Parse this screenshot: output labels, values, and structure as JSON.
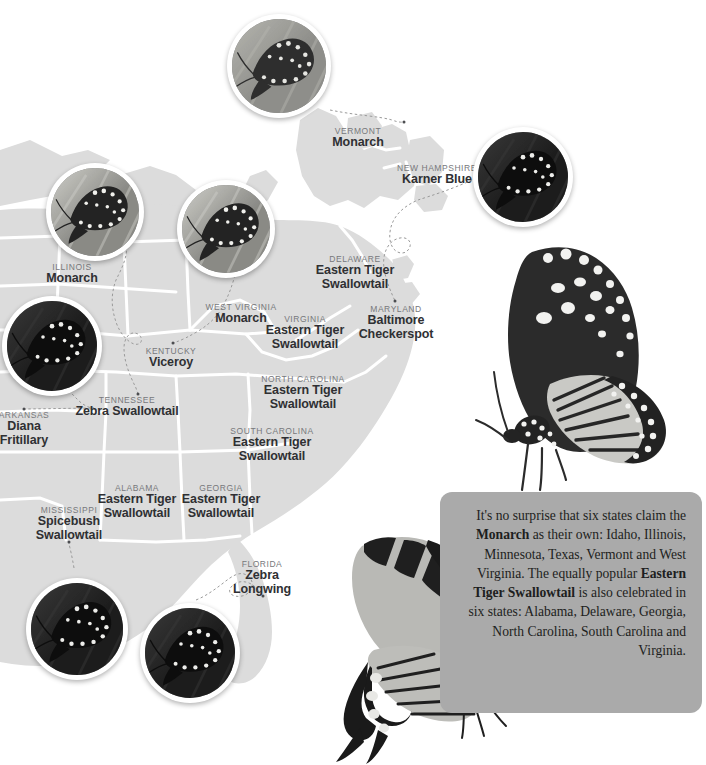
{
  "colors": {
    "page_background": "#ffffff",
    "state_fill": "#dcdcdc",
    "state_border": "#ffffff",
    "state_name_text": "#77787b",
    "butterfly_name_text": "#2f3033",
    "caption_background": "#aaaaaa",
    "caption_text": "#1d1e20",
    "photo_ring": "#ffffff",
    "connector_line": "#9a9a9a",
    "marker_dot": "#4c4d50"
  },
  "map": {
    "labels": [
      {
        "id": "vermont",
        "state": "VERMONT",
        "butterfly": "Monarch",
        "x": 358,
        "y": 127,
        "lines": 1,
        "dot": {
          "x": 404,
          "y": 122
        }
      },
      {
        "id": "new-hampshire",
        "state": "NEW HAMPSHIRE",
        "butterfly": "Karner Blue",
        "x": 437,
        "y": 164,
        "lines": 1,
        "dot": null
      },
      {
        "id": "illinois",
        "state": "ILLINOIS",
        "butterfly": "Monarch",
        "x": 72,
        "y": 263,
        "lines": 1,
        "dot": null
      },
      {
        "id": "delaware",
        "state": "DELAWARE",
        "butterfly": "Eastern Tiger Swallowtail",
        "x": 355,
        "y": 255,
        "lines": 2,
        "dot": null
      },
      {
        "id": "west-virginia",
        "state": "WEST VIRGINIA",
        "butterfly": "Monarch",
        "x": 241,
        "y": 303,
        "lines": 1,
        "dot": null
      },
      {
        "id": "virginia",
        "state": "VIRGINIA",
        "butterfly": "Eastern Tiger Swallowtail",
        "x": 305,
        "y": 315,
        "lines": 2,
        "dot": null
      },
      {
        "id": "maryland",
        "state": "MARYLAND",
        "butterfly": "Baltimore Checkerspot",
        "x": 396,
        "y": 305,
        "lines": 2,
        "dot": {
          "x": 395,
          "y": 301
        }
      },
      {
        "id": "kentucky",
        "state": "KENTUCKY",
        "butterfly": "Viceroy",
        "x": 171,
        "y": 347,
        "lines": 1,
        "dot": {
          "x": 173,
          "y": 343
        }
      },
      {
        "id": "north-carolina",
        "state": "NORTH CAROLINA",
        "butterfly": "Eastern Tiger Swallowtail",
        "x": 303,
        "y": 375,
        "lines": 2,
        "dot": null
      },
      {
        "id": "tennessee",
        "state": "TENNESSEE",
        "butterfly": "Zebra Swallowtail",
        "x": 127,
        "y": 396,
        "lines": 1,
        "dot": {
          "x": 138,
          "y": 394
        }
      },
      {
        "id": "arkansas",
        "state": "ARKANSAS",
        "butterfly": "Diana Fritillary",
        "x": 24,
        "y": 411,
        "lines": 2,
        "dot": {
          "x": 24,
          "y": 409
        }
      },
      {
        "id": "south-carolina",
        "state": "SOUTH CAROLINA",
        "butterfly": "Eastern Tiger Swallowtail",
        "x": 272,
        "y": 427,
        "lines": 2,
        "dot": null
      },
      {
        "id": "alabama",
        "state": "ALABAMA",
        "butterfly": "Eastern Tiger Swallowtail",
        "x": 137,
        "y": 484,
        "lines": 2,
        "dot": null
      },
      {
        "id": "georgia",
        "state": "GEORGIA",
        "butterfly": "Eastern Tiger Swallowtail",
        "x": 221,
        "y": 484,
        "lines": 2,
        "dot": null
      },
      {
        "id": "mississippi",
        "state": "MISSISSIPPI",
        "butterfly": "Spicebush Swallowtail",
        "x": 69,
        "y": 506,
        "lines": 2,
        "dot": {
          "x": 69,
          "y": 542
        }
      },
      {
        "id": "florida",
        "state": "FLORIDA",
        "butterfly": "Zebra Longwing",
        "x": 262,
        "y": 560,
        "lines": 2,
        "dot": {
          "x": 263,
          "y": 596
        }
      }
    ]
  },
  "photos": [
    {
      "id": "photo-karner-blue",
      "alt": "karner-blue-butterfly-photo",
      "x": 227,
      "y": 14,
      "size": 104,
      "tone": "grass"
    },
    {
      "id": "photo-baltimore-checkerspot",
      "alt": "baltimore-checkerspot-butterfly-photo",
      "x": 473,
      "y": 127,
      "size": 100,
      "tone": "dark"
    },
    {
      "id": "photo-zebra-swallowtail",
      "alt": "zebra-swallowtail-butterfly-photo",
      "x": 46,
      "y": 163,
      "size": 98,
      "tone": "light"
    },
    {
      "id": "photo-viceroy",
      "alt": "viceroy-butterfly-photo",
      "x": 177,
      "y": 180,
      "size": 98,
      "tone": "light"
    },
    {
      "id": "photo-diana-fritillary",
      "alt": "diana-fritillary-butterfly-photo",
      "x": 2,
      "y": 296,
      "size": 100,
      "tone": "dark"
    },
    {
      "id": "photo-spicebush-swallowtail",
      "alt": "spicebush-swallowtail-butterfly-photo",
      "x": 26,
      "y": 578,
      "size": 102,
      "tone": "dark"
    },
    {
      "id": "photo-zebra-longwing",
      "alt": "zebra-longwing-butterfly-photo",
      "x": 140,
      "y": 603,
      "size": 100,
      "tone": "dark"
    }
  ],
  "feature_butterflies": [
    {
      "id": "monarch-large",
      "alt": "monarch-butterfly-illustration",
      "x": 462,
      "y": 244,
      "w": 236,
      "h": 262
    },
    {
      "id": "swallowtail-large",
      "alt": "eastern-tiger-swallowtail-illustration",
      "x": 308,
      "y": 532,
      "w": 232,
      "h": 233
    }
  ],
  "caption": {
    "x": 440,
    "y": 492,
    "w": 262,
    "h": 221,
    "segments": [
      {
        "text": "It's no surprise that six states claim the ",
        "bold": false
      },
      {
        "text": "Monarch",
        "bold": true
      },
      {
        "text": " as their own: Idaho, Illinois, Minnesota, Texas, Vermont and West Virginia. The equally popular ",
        "bold": false
      },
      {
        "text": "Eastern Tiger Swallowtail",
        "bold": true
      },
      {
        "text": " is also celebrated in six states: Alabama, Delaware, Georgia, North Carolina, South Carolina and Virginia.",
        "bold": false
      }
    ],
    "plain_text": "It's no surprise that six states claim the Monarch as their own: Idaho, Illinois, Minnesota, Texas, Vermont and West Virginia. The equally popular Eastern Tiger Swallowtail is also celebrated in six states: Alabama, Delaware, Georgia, North Carolina, South Carolina and Virginia."
  }
}
